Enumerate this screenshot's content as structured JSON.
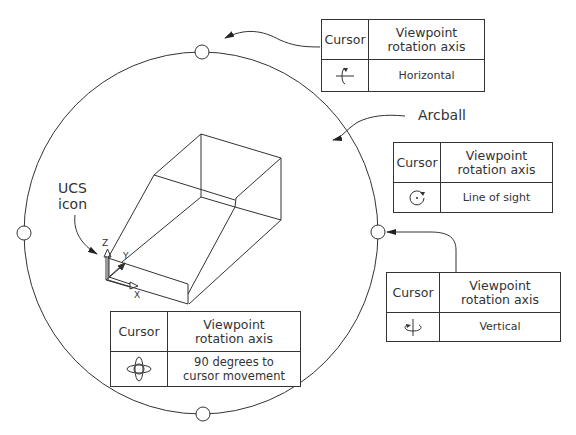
{
  "labels": {
    "arcball": "Arcball",
    "ucs_line1": "UCS",
    "ucs_line2": "icon",
    "axis_x": "X",
    "axis_y": "Y",
    "axis_z": "Z"
  },
  "tables": {
    "header_cursor": "Cursor",
    "header_axis_line1": "Viewpoint",
    "header_axis_line2": "rotation  axis",
    "horizontal": {
      "icon": "horizontal-rotation-cursor-icon",
      "value": "Horizontal"
    },
    "line_of_sight": {
      "icon": "line-of-sight-rotation-cursor-icon",
      "value": "Line of sight"
    },
    "vertical": {
      "icon": "vertical-rotation-cursor-icon",
      "value": "Vertical"
    },
    "free": {
      "icon": "free-rotation-cursor-icon",
      "value_line1": "90 degrees to",
      "value_line2": "cursor movement"
    }
  },
  "colors": {
    "line": "#333333",
    "background": "#ffffff"
  }
}
